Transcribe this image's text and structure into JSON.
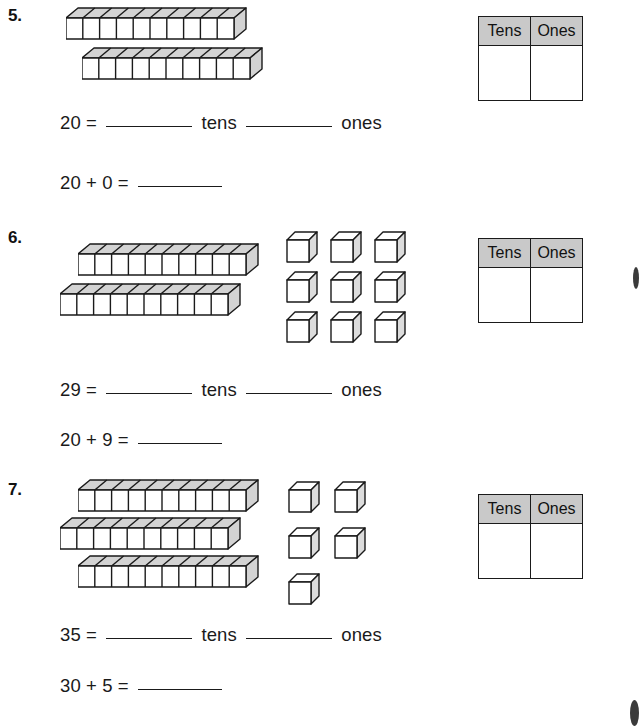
{
  "page": {
    "width": 638,
    "height": 728,
    "background": "#ffffff",
    "ink_color": "#1a1a1a",
    "header_fill": "#c9c9c9"
  },
  "table_headers": {
    "tens": "Tens",
    "ones": "Ones"
  },
  "problems": [
    {
      "number": "5.",
      "value_text": "20",
      "equals": "=",
      "tens_word": "tens",
      "ones_word": "ones",
      "sum_line": "20 + 0 =",
      "rods": 2,
      "cubes": 0,
      "cubes_per_rod": 10,
      "top": 0
    },
    {
      "number": "6.",
      "value_text": "29",
      "equals": "=",
      "tens_word": "tens",
      "ones_word": "ones",
      "sum_line": "20 + 9 =",
      "rods": 2,
      "cubes": 9,
      "cubes_per_rod": 10,
      "top": 222
    },
    {
      "number": "7.",
      "value_text": "35",
      "equals": "=",
      "tens_word": "tens",
      "ones_word": "ones",
      "sum_line": "30 + 5 =",
      "rods": 3,
      "cubes": 5,
      "cubes_per_rod": 10,
      "top": 472
    }
  ],
  "icons": {
    "rod": "base-ten-rod-icon",
    "cube": "base-ten-unit-cube-icon"
  }
}
